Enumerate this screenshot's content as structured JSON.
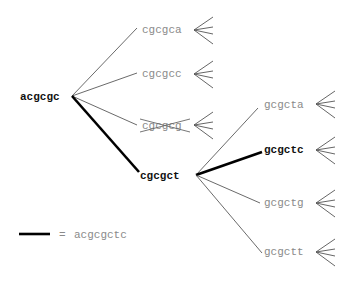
{
  "diagram": {
    "root": {
      "label": "acgcgc",
      "highlighted": true
    },
    "level1": [
      {
        "label": "cgcgca",
        "highlighted": false,
        "pruned": false
      },
      {
        "label": "cgcgcc",
        "highlighted": false,
        "pruned": false
      },
      {
        "label": "cgcgcg",
        "highlighted": false,
        "pruned": true
      },
      {
        "label": "cgcgct",
        "highlighted": true,
        "pruned": false
      }
    ],
    "level2": [
      {
        "label": "gcgcta",
        "highlighted": false
      },
      {
        "label": "gcgctc",
        "highlighted": true
      },
      {
        "label": "gcgctg",
        "highlighted": false
      },
      {
        "label": "gcgctt",
        "highlighted": false
      }
    ],
    "legend": {
      "symbol": "thick-black-line",
      "equals": "=",
      "text": "acgcgctc"
    },
    "colors": {
      "highlighted": "#111111",
      "normal": "#8a8a8a",
      "edge": "#444444"
    }
  }
}
